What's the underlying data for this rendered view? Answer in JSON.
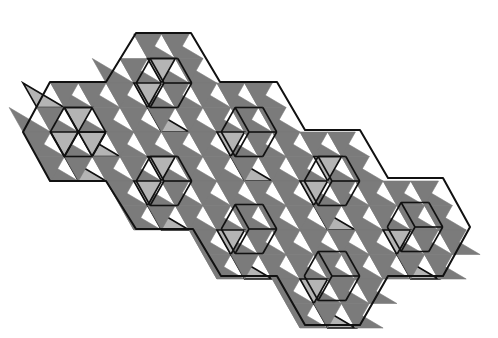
{
  "figure": {
    "colors": {
      "background": "#ffffff",
      "dark_tile": "#7b7b7b",
      "light_tile": "#b4b4b4",
      "edge": "#111111"
    },
    "lattice": {
      "origin_x": 23,
      "origin_y": 132,
      "unit_x": 27.7,
      "unit_y": 24.5
    },
    "outline_px": [
      [
        23,
        132
      ],
      [
        50,
        82
      ],
      [
        106,
        82
      ],
      [
        136,
        33
      ],
      [
        191,
        33
      ],
      [
        220,
        82
      ],
      [
        277,
        82
      ],
      [
        305,
        130
      ],
      [
        360,
        130
      ],
      [
        388,
        178
      ],
      [
        443,
        178
      ],
      [
        470,
        227
      ],
      [
        443,
        276
      ],
      [
        388,
        276
      ],
      [
        360,
        325
      ],
      [
        305,
        325
      ],
      [
        277,
        276
      ],
      [
        221,
        276
      ],
      [
        193,
        229
      ],
      [
        136,
        229
      ],
      [
        106,
        181
      ],
      [
        50,
        181
      ]
    ],
    "hexagon_centers_px": [
      [
        78,
        132
      ],
      [
        164,
        83
      ],
      [
        249,
        132
      ],
      [
        164,
        181
      ],
      [
        332,
        181
      ],
      [
        249,
        229
      ],
      [
        415,
        227
      ],
      [
        332,
        276
      ]
    ]
  }
}
